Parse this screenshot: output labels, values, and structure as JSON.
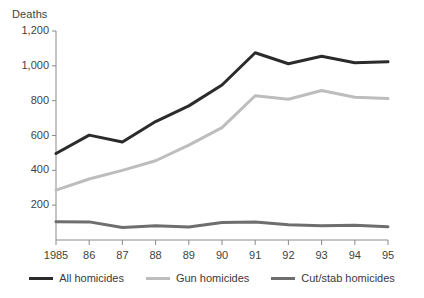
{
  "chart_data": {
    "type": "line",
    "title": "",
    "ylabel": "Deaths",
    "xlabel": "",
    "ylim": [
      0,
      1200
    ],
    "yticks": [
      0,
      200,
      400,
      600,
      800,
      1000,
      1200
    ],
    "ytick_labels": [
      "",
      "200",
      "400",
      "600",
      "800",
      "1,000",
      "1,200"
    ],
    "grid": false,
    "legend_position": "bottom",
    "x": [
      1985,
      1986,
      1987,
      1988,
      1989,
      1990,
      1991,
      1992,
      1993,
      1994,
      1995
    ],
    "xtick_labels": [
      "1985",
      "86",
      "87",
      "88",
      "89",
      "90",
      "91",
      "92",
      "93",
      "94",
      "95"
    ],
    "series": [
      {
        "name": "All homicides",
        "color": "#2b2b2b",
        "width": 3,
        "values": [
          497,
          602,
          563,
          680,
          770,
          890,
          1075,
          1012,
          1055,
          1018,
          1023
        ]
      },
      {
        "name": "Gun homicides",
        "color": "#bdbdbd",
        "width": 3,
        "values": [
          286,
          350,
          400,
          455,
          545,
          645,
          828,
          808,
          858,
          820,
          812
        ]
      },
      {
        "name": "Cut/stab homicides",
        "color": "#6e6e6e",
        "width": 3,
        "values": [
          105,
          104,
          72,
          82,
          74,
          100,
          104,
          88,
          82,
          84,
          76
        ]
      }
    ]
  },
  "legend": {
    "items": [
      {
        "label": "All homicides",
        "color": "#2b2b2b"
      },
      {
        "label": "Gun homicides",
        "color": "#bdbdbd"
      },
      {
        "label": "Cut/stab homicides",
        "color": "#6e6e6e"
      }
    ]
  },
  "axes": {
    "y_axis_title": "Deaths",
    "axis_color": "#8a8a8a"
  }
}
